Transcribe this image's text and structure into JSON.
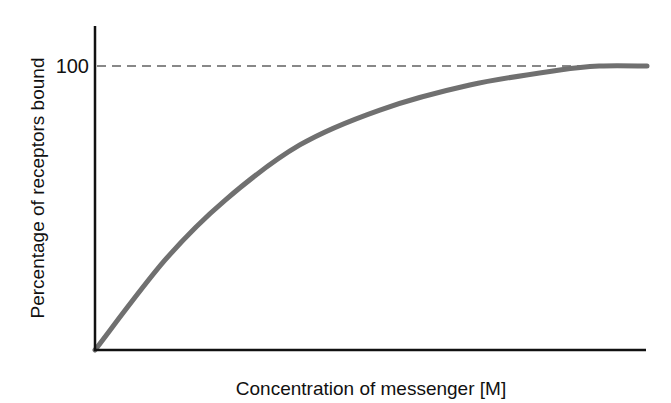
{
  "chart_data": {
    "type": "line",
    "title": "",
    "xlabel": "Concentration of messenger [M]",
    "ylabel": "Percentage of receptors bound",
    "y_ticks": [
      "100"
    ],
    "xlim": [
      0,
      100
    ],
    "ylim": [
      0,
      100
    ],
    "grid": false,
    "legend": null,
    "reference_line": {
      "y": 100,
      "style": "dashed",
      "color": "#888888"
    },
    "series": [
      {
        "name": "Receptor binding",
        "color": "#707070",
        "x": [
          0,
          12.7,
          23.6,
          37.1,
          51.6,
          67.9,
          84.2,
          91.5,
          100
        ],
        "y": [
          0,
          31.7,
          52.8,
          72.2,
          84.5,
          93.3,
          98.6,
          100,
          100
        ]
      }
    ]
  }
}
